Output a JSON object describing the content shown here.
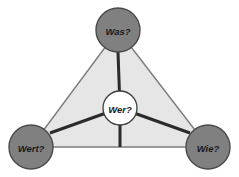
{
  "diagram": {
    "type": "triangle-relationship-diagram",
    "background_color": "#ffffff",
    "triangle": {
      "name": "value-triangle",
      "fill_color": "#e6e6e6",
      "stroke_color": "#7d7d7d",
      "vertices": {
        "top": {
          "x": 118,
          "y": 30
        },
        "bottom_left": {
          "x": 31,
          "y": 147
        },
        "bottom_right": {
          "x": 208,
          "y": 147
        }
      }
    },
    "center_node": {
      "label": "Wer?",
      "x": 120,
      "y": 108,
      "radius": 17,
      "fill_color": "#ffffff",
      "stroke_color": "#3d3d3d"
    },
    "vertex_nodes": [
      {
        "id": "top",
        "label": "Was?",
        "x": 118,
        "y": 30,
        "radius": 22,
        "fill_color": "#808080",
        "stroke_color": "#4a4a4a"
      },
      {
        "id": "bottom-left",
        "label": "Wert?",
        "x": 31,
        "y": 147,
        "radius": 22,
        "fill_color": "#808080",
        "stroke_color": "#4a4a4a"
      },
      {
        "id": "bottom-right",
        "label": "Wie?",
        "x": 208,
        "y": 147,
        "radius": 22,
        "fill_color": "#808080",
        "stroke_color": "#4a4a4a"
      }
    ],
    "spokes": [
      {
        "id": "center-to-top",
        "from": "center",
        "to": "top",
        "color": "#2b2b2b",
        "width": 3
      },
      {
        "id": "center-to-bottom-left",
        "from": "center",
        "to": "bottom-left",
        "color": "#2b2b2b",
        "width": 3
      },
      {
        "id": "center-to-bottom-right",
        "from": "center",
        "to": "bottom-right",
        "color": "#2b2b2b",
        "width": 3
      }
    ]
  }
}
